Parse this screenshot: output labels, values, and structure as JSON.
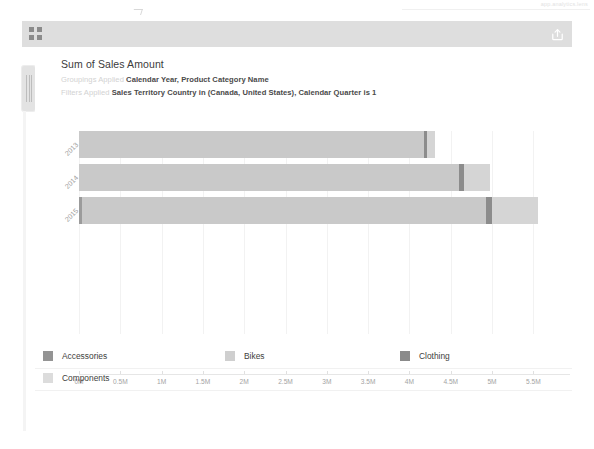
{
  "browser": {
    "address_hint": "app.analytics.lens",
    "share_icon": "share-icon",
    "waffle_icon": "app-launcher-grid-icon"
  },
  "card": {
    "title": "Sum of Sales Amount",
    "groupings": {
      "key": "Groupings Applied",
      "value": "Calendar Year, Product Category Name"
    },
    "filters": {
      "key": "Filters Applied",
      "value": "Sales Territory Country in (Canada, United States), Calendar Quarter is 1"
    }
  },
  "colors": {
    "accessories": "#949494",
    "bikes": "#cfcfcf",
    "clothing": "#8a8a8a",
    "components": "#dcdcdc",
    "axis": "#a3a3a3",
    "grid": "#f2f2f2",
    "header_bar": "#dedede"
  },
  "legend": {
    "rows": [
      [
        {
          "label": "Accessories",
          "key": "accessories",
          "left": 8
        },
        {
          "label": "Bikes",
          "key": "bikes",
          "left": 190
        },
        {
          "label": "Clothing",
          "key": "clothing",
          "left": 365
        }
      ],
      [
        {
          "label": "Components",
          "key": "components",
          "left": 8
        }
      ]
    ]
  },
  "chart_data": {
    "type": "bar",
    "orientation": "horizontal",
    "stacked": true,
    "title": "Sum of Sales Amount",
    "xlabel": "",
    "ylabel": "",
    "xlim": [
      0,
      5.75
    ],
    "grid": true,
    "legend_position": "bottom",
    "categories": [
      "2013",
      "2014",
      "2015"
    ],
    "xticks": [
      "0M",
      "0.5M",
      "1M",
      "1.5M",
      "2M",
      "2.5M",
      "3M",
      "3.5M",
      "4M",
      "4.5M",
      "5M",
      "5.5M"
    ],
    "xtick_values": [
      0,
      0.5,
      1,
      1.5,
      2,
      2.5,
      3,
      3.5,
      4,
      4.5,
      5,
      5.5
    ],
    "units": "millions",
    "series": [
      {
        "name": "Accessories",
        "key": "accessories",
        "values": [
          0.0,
          0.0,
          0.04
        ]
      },
      {
        "name": "Bikes",
        "key": "bikes",
        "values": [
          4.18,
          4.6,
          4.89
        ]
      },
      {
        "name": "Clothing",
        "key": "clothing",
        "values": [
          0.035,
          0.055,
          0.065
        ]
      },
      {
        "name": "Components",
        "key": "components",
        "values": [
          0.1,
          0.32,
          0.56
        ]
      }
    ],
    "totals": [
      4.315,
      4.975,
      5.555
    ]
  }
}
